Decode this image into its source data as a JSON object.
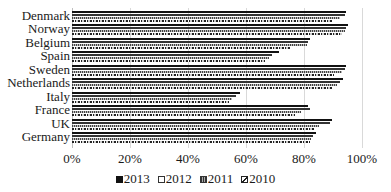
{
  "chart_data": {
    "type": "bar",
    "orientation": "horizontal",
    "title": "",
    "xlabel": "",
    "ylabel": "",
    "xlim": [
      0,
      100
    ],
    "x_ticks": [
      "0%",
      "20%",
      "40%",
      "60%",
      "80%",
      "100%"
    ],
    "grid": true,
    "legend_position": "bottom",
    "categories": [
      "Denmark",
      "Norway",
      "Belgium",
      "Spain",
      "Sweden",
      "Netherlands",
      "Italy",
      "France",
      "UK",
      "Germany"
    ],
    "series": [
      {
        "name": "2013",
        "values": [
          94.5,
          95,
          82,
          71.5,
          94.5,
          93.5,
          58,
          81.5,
          89.5,
          84
        ]
      },
      {
        "name": "2012",
        "values": [
          94,
          94.5,
          81.5,
          69,
          94,
          92.5,
          56.5,
          82,
          89,
          83
        ]
      },
      {
        "name": "2011",
        "values": [
          92.5,
          94,
          81,
          68,
          93,
          91.5,
          55,
          79,
          85,
          82.5
        ]
      },
      {
        "name": "2010",
        "values": [
          90,
          93,
          75,
          66.5,
          90.5,
          89.5,
          54,
          77,
          83.5,
          82
        ]
      }
    ]
  },
  "axis": {
    "ticks": [
      "0%",
      "20%",
      "40%",
      "60%",
      "80%",
      "100%"
    ]
  },
  "legend": {
    "items": [
      {
        "label": "2013",
        "swatch": "solid-black"
      },
      {
        "label": "2012",
        "swatch": "white-outline"
      },
      {
        "label": "2011",
        "swatch": "vertical-hatch"
      },
      {
        "label": "2010",
        "swatch": "diagonal-hatch"
      }
    ]
  }
}
